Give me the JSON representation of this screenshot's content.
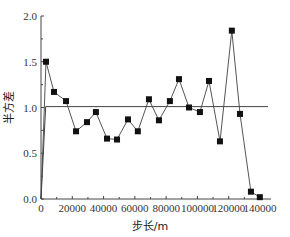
{
  "chart_data": {
    "type": "line",
    "title": "",
    "xlabel": "步长/m",
    "ylabel": "半方差",
    "xlim": [
      0,
      145000
    ],
    "ylim": [
      0.0,
      2.0
    ],
    "x_ticks": [
      0,
      20000,
      40000,
      60000,
      80000,
      100000,
      120000,
      140000
    ],
    "x_tick_labels": [
      "0",
      "20000",
      "40000",
      "60000",
      "80000",
      "100000",
      "120000",
      "140000"
    ],
    "y_ticks": [
      0.0,
      0.5,
      1.0,
      1.5,
      2.0
    ],
    "y_tick_labels": [
      "0.0",
      "0.5",
      "1.0",
      "1.5",
      "2.0"
    ],
    "grid": false,
    "legend": null,
    "series": [
      {
        "name": "experimental semivariance",
        "marker": "square",
        "x": [
          3200,
          8300,
          16000,
          22400,
          29400,
          35100,
          42200,
          48600,
          55600,
          61900,
          69000,
          75400,
          82400,
          88200,
          94600,
          101600,
          107400,
          114400,
          122000,
          127200,
          134200,
          139900
        ],
        "values": [
          1.5,
          1.17,
          1.07,
          0.74,
          0.84,
          0.95,
          0.66,
          0.65,
          0.87,
          0.74,
          1.09,
          0.86,
          1.07,
          1.31,
          1.0,
          0.95,
          1.29,
          0.63,
          1.84,
          0.93,
          0.08,
          0.02
        ]
      },
      {
        "name": "fitted model",
        "marker": "none",
        "x": [
          0,
          3000,
          145000
        ],
        "values": [
          0.0,
          1.01,
          1.01
        ]
      }
    ]
  }
}
